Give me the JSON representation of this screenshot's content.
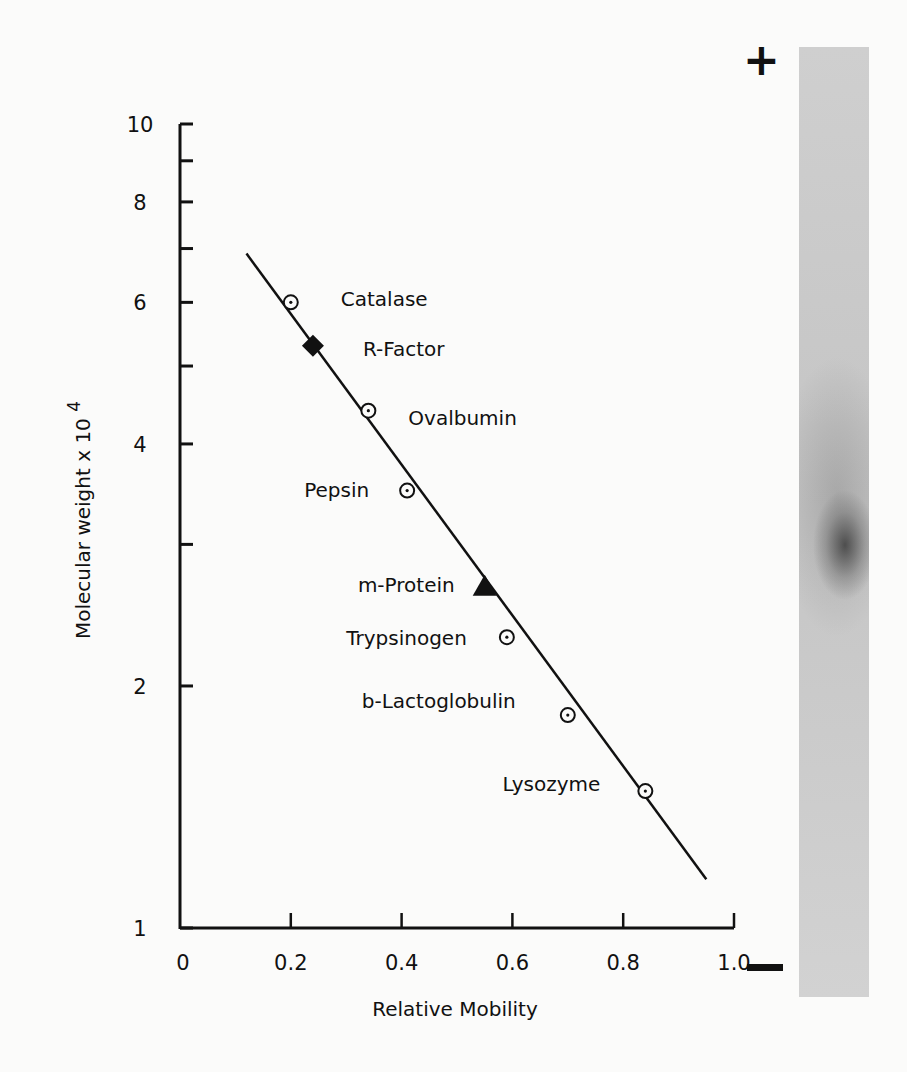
{
  "chart_data": {
    "type": "scatter",
    "title": "",
    "xlabel": "Relative Mobility",
    "ylabel": "Molecular weight x 10",
    "ylabel_exponent": "4",
    "yscale": "log",
    "xlim": [
      0,
      1.0
    ],
    "ylim": [
      1,
      10
    ],
    "x_ticks": [
      0,
      0.2,
      0.4,
      0.6,
      0.8,
      1.0
    ],
    "x_tick_labels": [
      "0",
      "0.2",
      "0.4",
      "0.6",
      "0.8",
      "1.0"
    ],
    "y_ticks": [
      1,
      2,
      3,
      4,
      5,
      6,
      7,
      8,
      9,
      10
    ],
    "y_tick_labels": [
      "1",
      "2",
      "",
      "4",
      "",
      "6",
      "",
      "8",
      "",
      "10"
    ],
    "grid": false,
    "series": [
      {
        "name": "Standard proteins",
        "marker": "circle-dot",
        "points": [
          {
            "label": "Catalase",
            "x": 0.2,
            "y": 6.0
          },
          {
            "label": "Ovalbumin",
            "x": 0.34,
            "y": 4.4
          },
          {
            "label": "Pepsin",
            "x": 0.41,
            "y": 3.5
          },
          {
            "label": "Trypsinogen",
            "x": 0.59,
            "y": 2.3
          },
          {
            "label": "b-Lactoglobulin",
            "x": 0.7,
            "y": 1.84
          },
          {
            "label": "Lysozyme",
            "x": 0.84,
            "y": 1.48
          }
        ]
      },
      {
        "name": "R-Factor",
        "marker": "filled-diamond",
        "points": [
          {
            "label": "R-Factor",
            "x": 0.24,
            "y": 5.3
          }
        ]
      },
      {
        "name": "m-Protein",
        "marker": "filled-triangle",
        "points": [
          {
            "label": "m-Protein",
            "x": 0.55,
            "y": 2.65
          }
        ]
      }
    ],
    "fit_line": {
      "x": [
        0.12,
        0.95
      ],
      "y": [
        6.9,
        1.15
      ]
    },
    "annotations": {
      "gel_anode": "+",
      "gel_cathode": "−",
      "gel_band_relative_position": 0.52
    }
  }
}
